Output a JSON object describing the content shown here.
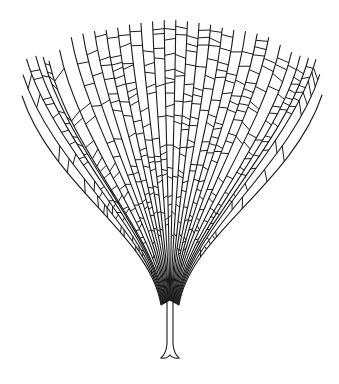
{
  "illustration": {
    "subject": "fan-shaped branching filamentous alga (line drawing)",
    "background": "#ffffff",
    "stroke_color": "#1a1a1a",
    "stroke_width": 1.1,
    "canvas": {
      "width": 339,
      "height": 384
    },
    "holdfast": {
      "x": 170,
      "y": 352,
      "foot_y": 358,
      "foot_half_width": 9
    },
    "stem": {
      "top_y": 300,
      "bottom_y": 344,
      "half_width": 3
    },
    "fan": {
      "apex_x": 170,
      "apex_y": 300,
      "filament_count": 32,
      "tip_outline": [
        [
          22,
          96
        ],
        [
          24,
          60
        ],
        [
          40,
          55
        ],
        [
          50,
          62
        ],
        [
          70,
          38
        ],
        [
          90,
          32
        ],
        [
          110,
          30
        ],
        [
          130,
          25
        ],
        [
          150,
          22
        ],
        [
          170,
          20
        ],
        [
          190,
          22
        ],
        [
          210,
          25
        ],
        [
          230,
          30
        ],
        [
          250,
          32
        ],
        [
          270,
          38
        ],
        [
          290,
          52
        ],
        [
          305,
          58
        ],
        [
          318,
          60
        ],
        [
          322,
          95
        ]
      ],
      "rung_spacing_px": 10,
      "rung_probability": 0.82
    }
  }
}
